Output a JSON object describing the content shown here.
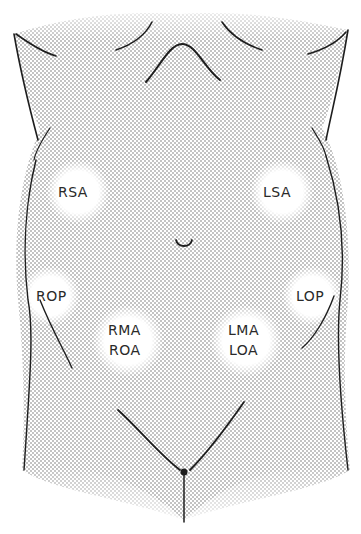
{
  "diagram": {
    "colors": {
      "stipple": "#9a9a9a",
      "outline": "#1e1e1e",
      "background": "#ffffff",
      "spot": "#ffffff"
    },
    "labels": {
      "rsa": "RSA",
      "lsa": "LSA",
      "rop": "ROP",
      "lop": "LOP",
      "rma": "RMA",
      "roa": "ROA",
      "lma": "LMA",
      "loa": "LOA"
    },
    "regions": [
      {
        "id": "rsa",
        "cx": 78,
        "cy": 192,
        "r": 30
      },
      {
        "id": "lsa",
        "cx": 282,
        "cy": 192,
        "r": 30
      },
      {
        "id": "rop",
        "cx": 52,
        "cy": 296,
        "r": 30
      },
      {
        "id": "lop",
        "cx": 310,
        "cy": 296,
        "r": 30
      },
      {
        "id": "rma-roa",
        "cx": 128,
        "cy": 341,
        "r": 34
      },
      {
        "id": "lma-loa",
        "cx": 246,
        "cy": 341,
        "r": 34
      }
    ]
  }
}
